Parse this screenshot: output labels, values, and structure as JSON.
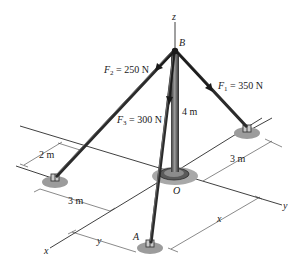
{
  "diagram": {
    "type": "3D statics problem: pole BO held by three cables",
    "points": {
      "top": "B",
      "origin": "O",
      "anchor_a": "A"
    },
    "axes": {
      "z": "z",
      "y": "y",
      "x": "x"
    },
    "forces": {
      "f1": {
        "symbol": "F",
        "subscript": "1",
        "value": " = 350 N"
      },
      "f2": {
        "symbol": "F",
        "subscript": "2",
        "value": " = 250 N"
      },
      "f3": {
        "symbol": "F",
        "subscript": "3",
        "value": " = 300 N"
      }
    },
    "dimensions": {
      "pole_height": "4 m",
      "left_anchor_offset": "2 m",
      "left_anchor_distance": "3 m",
      "right_anchor_distance": "3 m",
      "a_x": "x",
      "a_y": "y"
    },
    "colors": {
      "line": "#2a2a2a",
      "pole_dark": "#3a3a3a",
      "pole_light": "#8a8a8a",
      "base_shadow": "#9c9c9c"
    }
  }
}
